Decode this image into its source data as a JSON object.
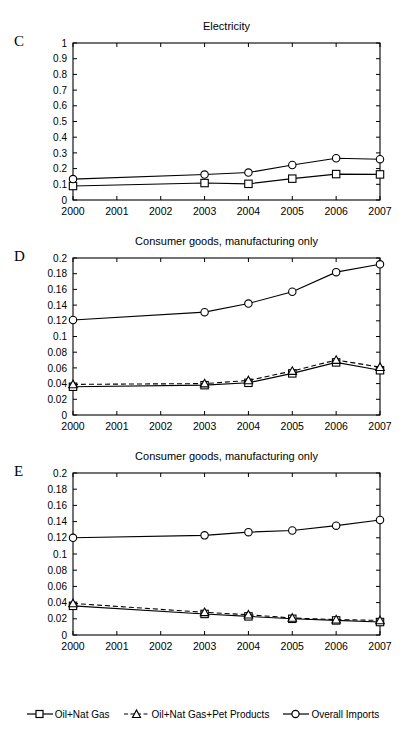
{
  "figure": {
    "background": "#ffffff",
    "line_color": "#000000",
    "marker_fill": "#ffffff"
  },
  "legend": {
    "position": "bottom-center",
    "items": [
      {
        "label": "Oil+Nat Gas",
        "marker": "square",
        "line": "solid",
        "icon": "legend-square-icon"
      },
      {
        "label": "Oil+Nat Gas+Pet Products",
        "marker": "triangle",
        "line": "dashed",
        "icon": "legend-triangle-icon"
      },
      {
        "label": "Overall Imports",
        "marker": "circle",
        "line": "solid",
        "icon": "legend-circle-icon"
      }
    ]
  },
  "panels": [
    {
      "letter": "C",
      "title": "Electricity"
    },
    {
      "letter": "D",
      "title": "Consumer goods, manufacturing only"
    },
    {
      "letter": "E",
      "title": "Consumer goods, manufacturing only"
    }
  ],
  "chart_data": [
    {
      "panel": "C",
      "type": "line",
      "title": "Electricity",
      "xlabel": "",
      "ylabel": "",
      "grid": false,
      "legend_position": "bottom-center",
      "categories": [
        "2000",
        "2001",
        "2002",
        "2003",
        "2004",
        "2005",
        "2006",
        "2007"
      ],
      "x_tick_labels": [
        "2000",
        "2001",
        "2002",
        "2003",
        "2004",
        "2005",
        "2006",
        "2007"
      ],
      "y_tick_labels": [
        "0",
        "0.1",
        "0.2",
        "0.3",
        "0.4",
        "0.5",
        "0.6",
        "0.7",
        "0.8",
        "0.9",
        "1"
      ],
      "xlim": [
        2000,
        2007
      ],
      "ylim": [
        0,
        1
      ],
      "ytick_step": 0.1,
      "series": [
        {
          "name": "Oil+Nat Gas",
          "marker": "square",
          "line": "solid",
          "x": [
            2000,
            2003,
            2004,
            2005,
            2006,
            2007
          ],
          "values": [
            0.089,
            0.108,
            0.103,
            0.136,
            0.165,
            0.163
          ]
        },
        {
          "name": "Overall Imports",
          "marker": "circle",
          "line": "solid",
          "x": [
            2000,
            2003,
            2004,
            2005,
            2006,
            2007
          ],
          "values": [
            0.133,
            0.162,
            0.175,
            0.223,
            0.266,
            0.26
          ]
        }
      ]
    },
    {
      "panel": "D",
      "type": "line",
      "title": "Consumer goods, manufacturing only",
      "xlabel": "",
      "ylabel": "",
      "grid": false,
      "legend_position": "bottom-center",
      "categories": [
        "2000",
        "2001",
        "2002",
        "2003",
        "2004",
        "2005",
        "2006",
        "2007"
      ],
      "x_tick_labels": [
        "2000",
        "2001",
        "2002",
        "2003",
        "2004",
        "2005",
        "2006",
        "2007"
      ],
      "y_tick_labels": [
        "0",
        "0.02",
        "0.04",
        "0.06",
        "0.08",
        "0.1",
        "0.12",
        "0.14",
        "0.16",
        "0.18",
        "0.2"
      ],
      "xlim": [
        2000,
        2007
      ],
      "ylim": [
        0,
        0.2
      ],
      "ytick_step": 0.02,
      "series": [
        {
          "name": "Oil+Nat Gas",
          "marker": "square",
          "line": "solid",
          "x": [
            2000,
            2003,
            2004,
            2005,
            2006,
            2007
          ],
          "values": [
            0.036,
            0.038,
            0.041,
            0.053,
            0.067,
            0.057
          ]
        },
        {
          "name": "Oil+Nat Gas+Pet Products",
          "marker": "triangle",
          "line": "dashed",
          "x": [
            2000,
            2003,
            2004,
            2005,
            2006,
            2007
          ],
          "values": [
            0.039,
            0.04,
            0.044,
            0.056,
            0.07,
            0.061
          ]
        },
        {
          "name": "Overall Imports",
          "marker": "circle",
          "line": "solid",
          "x": [
            2000,
            2003,
            2004,
            2005,
            2006,
            2007
          ],
          "values": [
            0.121,
            0.131,
            0.142,
            0.157,
            0.182,
            0.192
          ]
        }
      ]
    },
    {
      "panel": "E",
      "type": "line",
      "title": "Consumer goods, manufacturing only",
      "xlabel": "",
      "ylabel": "",
      "grid": false,
      "legend_position": "bottom-center",
      "categories": [
        "2000",
        "2001",
        "2002",
        "2003",
        "2004",
        "2005",
        "2006",
        "2007"
      ],
      "x_tick_labels": [
        "2000",
        "2001",
        "2002",
        "2003",
        "2004",
        "2005",
        "2006",
        "2007"
      ],
      "y_tick_labels": [
        "0",
        "0.02",
        "0.04",
        "0.06",
        "0.08",
        "0.1",
        "0.12",
        "0.14",
        "0.16",
        "0.18",
        "0.2"
      ],
      "xlim": [
        2000,
        2007
      ],
      "ylim": [
        0,
        0.2
      ],
      "ytick_step": 0.02,
      "series": [
        {
          "name": "Oil+Nat Gas",
          "marker": "square",
          "line": "solid",
          "x": [
            2000,
            2003,
            2004,
            2005,
            2006,
            2007
          ],
          "values": [
            0.036,
            0.026,
            0.023,
            0.02,
            0.018,
            0.016
          ]
        },
        {
          "name": "Oil+Nat Gas+Pet Products",
          "marker": "triangle",
          "line": "dashed",
          "x": [
            2000,
            2003,
            2004,
            2005,
            2006,
            2007
          ],
          "values": [
            0.039,
            0.028,
            0.025,
            0.021,
            0.019,
            0.018
          ]
        },
        {
          "name": "Overall Imports",
          "marker": "circle",
          "line": "solid",
          "x": [
            2000,
            2003,
            2004,
            2005,
            2006,
            2007
          ],
          "values": [
            0.12,
            0.123,
            0.127,
            0.129,
            0.135,
            0.142
          ]
        }
      ]
    }
  ]
}
